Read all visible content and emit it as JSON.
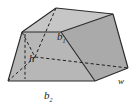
{
  "figure": {
    "kind": "trapezoidal-prism-diagram",
    "background_color": "#ffffff",
    "colors": {
      "face_front": "#b3b3b3",
      "face_top": "#c4c4c4",
      "face_right": "#a8a8a8",
      "face_left": "#bdbdbd",
      "edge_solid": "#2b2b2b",
      "edge_hidden": "#1f1f1f",
      "label_text": "#1a1a1a"
    },
    "labels": [
      {
        "id": "top-base",
        "symbol": "b",
        "subscript": "1",
        "text": "b1",
        "x": 57,
        "y": 40,
        "font_size": 11,
        "description": "Top base of the trapezoid"
      },
      {
        "id": "bottom-base",
        "symbol": "b",
        "subscript": "2",
        "text": "b2",
        "x": 44,
        "y": 99,
        "font_size": 11,
        "description": "Bottom base of the trapezoid"
      },
      {
        "id": "height",
        "symbol": "h",
        "subscript": "",
        "text": "h",
        "x": 29,
        "y": 62,
        "font_size": 11,
        "description": "Height of the trapezoid"
      },
      {
        "id": "width",
        "symbol": "w",
        "subscript": "",
        "text": "w",
        "x": 120,
        "y": 83,
        "font_size": 9,
        "description": "Width (depth) of the prism"
      }
    ],
    "geometry": {
      "front_face": "22,32 61,32 95,81 8,81",
      "top_face": "22,32 56,8 113,14 61,32",
      "right_face": "61,32 113,14 128,68 95,81",
      "hidden_vertex": "35,57",
      "hidden_edges": [
        "M 22,32 L 35,57",
        "M 56,8 L 35,57",
        "M 35,57 L 128,68",
        "M 35,57 L 8,81"
      ],
      "solid_edges": [
        "M 22,32 L 61,32",
        "M 22,32 L 8,81",
        "M 8,81 L 95,81",
        "M 95,81 L 61,32",
        "M 22,32 L 56,8",
        "M 56,8 L 113,14",
        "M 113,14 L 61,32",
        "M 113,14 L 128,68",
        "M 128,68 L 95,81"
      ]
    }
  }
}
